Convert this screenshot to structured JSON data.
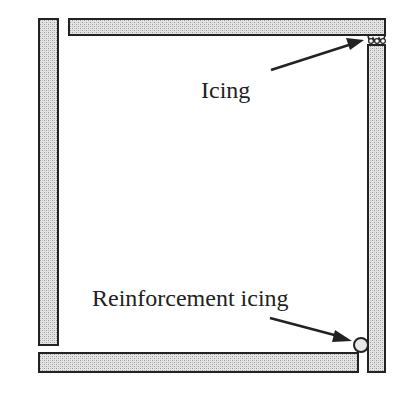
{
  "diagram": {
    "title": "",
    "labels": {
      "icing": "Icing",
      "reinforcement_icing": "Reinforcement icing"
    },
    "components": [
      {
        "name": "top-wall-panel",
        "type": "panel"
      },
      {
        "name": "left-wall-panel",
        "type": "panel"
      },
      {
        "name": "right-wall-panel",
        "type": "panel"
      },
      {
        "name": "bottom-wall-panel",
        "type": "panel"
      },
      {
        "name": "icing-joint",
        "type": "icing"
      },
      {
        "name": "reinforcement-icing-bead",
        "type": "icing"
      }
    ],
    "colors": {
      "outline": "#222222",
      "panel_fill": "#d9d9d9",
      "background": "#ffffff"
    }
  }
}
